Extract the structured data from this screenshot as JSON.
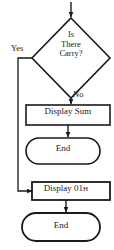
{
  "diagram": {
    "type": "flowchart",
    "background_color": "#ffffff",
    "stroke_color": "#1a1a1a",
    "text_color": "#1a1a1a",
    "nodes": [
      {
        "id": "entry-arrow",
        "shape": "arrow",
        "label": ""
      },
      {
        "id": "decision-carry",
        "shape": "diamond",
        "label_lines": [
          "Is",
          "There",
          "Carry?"
        ],
        "line1": "Is",
        "line2": "There",
        "line3": "Carry?"
      },
      {
        "id": "process-display-sum",
        "shape": "rectangle",
        "label": "Display Sum"
      },
      {
        "id": "terminator-end-top",
        "shape": "stadium",
        "label": "End"
      },
      {
        "id": "process-display-01h",
        "shape": "rectangle",
        "label": "Display 01",
        "hex_suffix": "H",
        "full_label": "Display 01H"
      },
      {
        "id": "terminator-end-bottom",
        "shape": "stadium",
        "label": "End"
      }
    ],
    "edges": [
      {
        "id": "edge-yes",
        "from": "decision-carry",
        "to": "process-display-01h",
        "label": "Yes",
        "direction": "left-down-right"
      },
      {
        "id": "edge-no",
        "from": "decision-carry",
        "to": "process-display-sum",
        "label": "No",
        "direction": "down"
      },
      {
        "id": "edge-sum-to-end",
        "from": "process-display-sum",
        "to": "terminator-end-top",
        "label": "",
        "direction": "down"
      },
      {
        "id": "edge-01h-to-end",
        "from": "process-display-01h",
        "to": "terminator-end-bottom",
        "label": "",
        "direction": "down"
      }
    ]
  }
}
